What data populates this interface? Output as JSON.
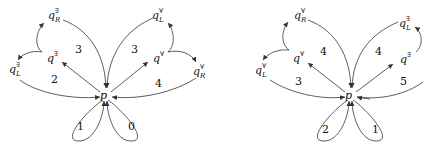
{
  "diagrams": [
    {
      "center": "p",
      "nodes": {
        "qR_exists": {
          "base": "q",
          "sup": "∃",
          "sub": "R"
        },
        "q_exists": {
          "base": "q",
          "sup": "∃"
        },
        "qL_exists": {
          "base": "q",
          "sup": "∃",
          "sub": "L"
        },
        "qL_forall": {
          "base": "q",
          "sup": "∀",
          "sub": "L"
        },
        "q_forall": {
          "base": "q",
          "sup": "∀"
        },
        "qR_forall": {
          "base": "q",
          "sup": "∀",
          "sub": "R"
        }
      },
      "region_labels": [
        "3",
        "3",
        "2",
        "4",
        "1",
        "0"
      ]
    },
    {
      "center": "p",
      "nodes": {
        "qR_forall": {
          "base": "q",
          "sup": "∀",
          "sub": "R"
        },
        "q_forall": {
          "base": "q",
          "sup": "∀"
        },
        "qL_forall": {
          "base": "q",
          "sup": "∀",
          "sub": "L"
        },
        "qL_exists": {
          "base": "q",
          "sup": "∃",
          "sub": "L"
        },
        "q_exists": {
          "base": "q",
          "sup": "∃"
        }
      },
      "region_labels": [
        "4",
        "4",
        "3",
        "5",
        "2",
        "1"
      ]
    }
  ]
}
